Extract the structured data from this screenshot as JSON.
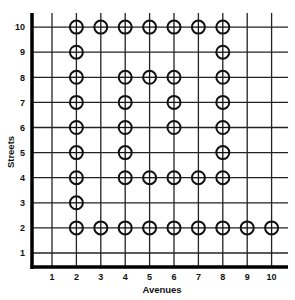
{
  "chart_data": {
    "type": "scatter",
    "title": "",
    "xlabel": "Avenues",
    "ylabel": "Streets",
    "xlim": [
      1,
      10
    ],
    "ylim": [
      1,
      10
    ],
    "x_ticks": [
      "1",
      "2",
      "3",
      "4",
      "5",
      "6",
      "7",
      "8",
      "9",
      "10"
    ],
    "y_ticks": [
      "1",
      "2",
      "3",
      "4",
      "5",
      "6",
      "7",
      "8",
      "9",
      "10"
    ],
    "grid": true,
    "marker": "circle-with-crosshair",
    "colors": {
      "line": "#222222",
      "axis": "#000000",
      "marker": "#111111",
      "background": "#ffffff"
    },
    "points": [
      {
        "x": 2,
        "y": 10
      },
      {
        "x": 3,
        "y": 10
      },
      {
        "x": 4,
        "y": 10
      },
      {
        "x": 5,
        "y": 10
      },
      {
        "x": 6,
        "y": 10
      },
      {
        "x": 7,
        "y": 10
      },
      {
        "x": 8,
        "y": 10
      },
      {
        "x": 2,
        "y": 9
      },
      {
        "x": 8,
        "y": 9
      },
      {
        "x": 2,
        "y": 8
      },
      {
        "x": 4,
        "y": 8
      },
      {
        "x": 5,
        "y": 8
      },
      {
        "x": 6,
        "y": 8
      },
      {
        "x": 8,
        "y": 8
      },
      {
        "x": 2,
        "y": 7
      },
      {
        "x": 4,
        "y": 7
      },
      {
        "x": 6,
        "y": 7
      },
      {
        "x": 8,
        "y": 7
      },
      {
        "x": 2,
        "y": 6
      },
      {
        "x": 4,
        "y": 6
      },
      {
        "x": 6,
        "y": 6
      },
      {
        "x": 8,
        "y": 6
      },
      {
        "x": 2,
        "y": 5
      },
      {
        "x": 4,
        "y": 5
      },
      {
        "x": 8,
        "y": 5
      },
      {
        "x": 2,
        "y": 4
      },
      {
        "x": 4,
        "y": 4
      },
      {
        "x": 5,
        "y": 4
      },
      {
        "x": 6,
        "y": 4
      },
      {
        "x": 7,
        "y": 4
      },
      {
        "x": 8,
        "y": 4
      },
      {
        "x": 2,
        "y": 3
      },
      {
        "x": 2,
        "y": 2
      },
      {
        "x": 3,
        "y": 2
      },
      {
        "x": 4,
        "y": 2
      },
      {
        "x": 5,
        "y": 2
      },
      {
        "x": 6,
        "y": 2
      },
      {
        "x": 7,
        "y": 2
      },
      {
        "x": 8,
        "y": 2
      },
      {
        "x": 9,
        "y": 2
      },
      {
        "x": 10,
        "y": 2
      }
    ]
  }
}
